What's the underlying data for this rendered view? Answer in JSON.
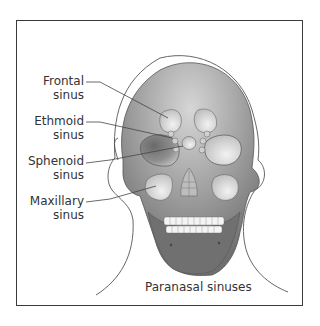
{
  "figure": {
    "caption": "Paranasal sinuses",
    "labels": [
      {
        "line1": "Frontal",
        "line2": "sinus"
      },
      {
        "line1": "Ethmoid",
        "line2": "sinus"
      },
      {
        "line1": "Sphenoid",
        "line2": "sinus"
      },
      {
        "line1": "Maxillary",
        "line2": "sinus"
      }
    ]
  },
  "colors": {
    "skull_dark": "#7a7a7a",
    "skull_light": "#d2d2d2",
    "sinus_fill": "#e4e4e4",
    "outline": "#4a4a4a",
    "frame": "#3a3a3a"
  }
}
